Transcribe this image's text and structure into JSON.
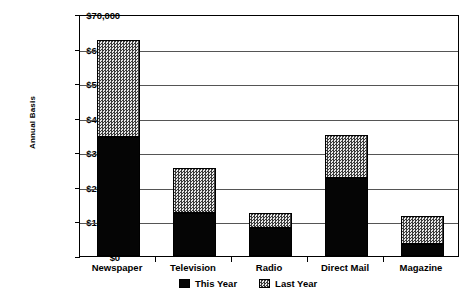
{
  "chart_data": {
    "type": "bar",
    "subtype": "stacked",
    "title": "",
    "xlabel": "",
    "ylabel": "Annual Basis",
    "ylim": [
      0,
      70000
    ],
    "ytick_values": [
      0,
      10000,
      20000,
      30000,
      40000,
      50000,
      60000,
      70000
    ],
    "ytick_labels": [
      "$0",
      "$10,000",
      "$20,000",
      "$30,000",
      "$40,000",
      "$50,000",
      "$60,000",
      "$70,000"
    ],
    "grid": true,
    "legend_position": "bottom",
    "categories": [
      "Newspaper",
      "Television",
      "Radio",
      "Direct Mail",
      "Magazine"
    ],
    "series": [
      {
        "name": "This Year",
        "color": "#050505",
        "pattern": "solid",
        "values": [
          34500,
          12500,
          8000,
          22500,
          3500
        ]
      },
      {
        "name": "Last Year",
        "color": "#d8d8d8",
        "pattern": "checker",
        "values": [
          28000,
          13000,
          4500,
          12500,
          8000
        ]
      }
    ],
    "totals": [
      62500,
      25500,
      12500,
      35000,
      11500
    ]
  },
  "legend": {
    "items": [
      {
        "label": "This Year",
        "swatch": "solid-black-swatch"
      },
      {
        "label": "Last Year",
        "swatch": "checker-gray-swatch"
      }
    ]
  }
}
